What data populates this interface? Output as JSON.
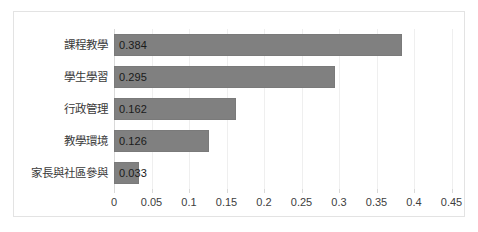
{
  "chart_data": {
    "type": "bar",
    "orientation": "horizontal",
    "title": "",
    "subtitle": "",
    "xlabel": "",
    "ylabel": "",
    "categories": [
      "課程教學",
      "學生學習",
      "行政管理",
      "教學環境",
      "家長與社區參與"
    ],
    "values": [
      0.384,
      0.295,
      0.162,
      0.126,
      0.033
    ],
    "data_labels": [
      "0.384",
      "0.295",
      "0.162",
      "0.126",
      "0.033"
    ],
    "xlim": [
      0,
      0.45
    ],
    "xticks": [
      0,
      0.05,
      0.1,
      0.15,
      0.2,
      0.25,
      0.3,
      0.35,
      0.4,
      0.45
    ],
    "xtick_labels": [
      "0",
      "0.05",
      "0.1",
      "0.15",
      "0.2",
      "0.25",
      "0.3",
      "0.35",
      "0.4",
      "0.45"
    ],
    "grid": "vertical",
    "legend": "none",
    "series": [
      {
        "name": "",
        "values": [
          0.384,
          0.295,
          0.162,
          0.126,
          0.033
        ]
      }
    ],
    "colors": {
      "bar": "#808080",
      "bar_border": "#7a7a7a",
      "gridline": "#efefef",
      "axis": "#d9d9d9",
      "frame_border": "#e3e3e3",
      "label_text": "#3a3a3a",
      "value_text": "#1a1a1a",
      "tick_text": "#404040",
      "background": "#ffffff"
    }
  }
}
